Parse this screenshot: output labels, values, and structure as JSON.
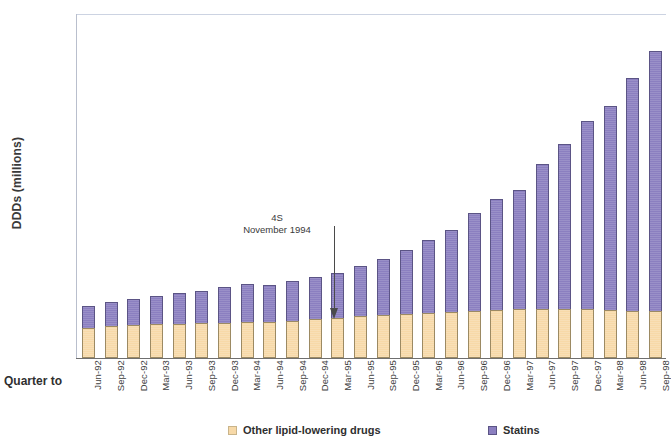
{
  "chart_data": {
    "type": "bar",
    "subtype": "stacked-bar",
    "title": "",
    "xlabel": "Quarter to",
    "ylabel": "DDDs (millions)",
    "ylim": [
      0,
      70
    ],
    "yticks": [
      0,
      10,
      20,
      30,
      40,
      50,
      60,
      70
    ],
    "grid": false,
    "legend_position": "bottom",
    "categories": [
      "Jun-92",
      "Sep-92",
      "Dec-92",
      "Mar-93",
      "Jun-93",
      "Sep-93",
      "Dec-93",
      "Mar-94",
      "Jun-94",
      "Sep-94",
      "Dec-94",
      "Mar-95",
      "Jun-95",
      "Sep-95",
      "Dec-95",
      "Mar-96",
      "Jun-96",
      "Sep-96",
      "Dec-96",
      "Mar-97",
      "Jun-97",
      "Sep-97",
      "Dec-97",
      "Mar-98",
      "Jun-98",
      "Sep-98"
    ],
    "series": [
      {
        "name": "Other lipid-lowering drugs",
        "color": "#f7d9a8",
        "values": [
          6.2,
          6.5,
          6.8,
          7.0,
          7.0,
          7.1,
          7.2,
          7.3,
          7.4,
          7.6,
          8.0,
          8.2,
          8.5,
          8.7,
          8.9,
          9.1,
          9.4,
          9.6,
          9.8,
          9.9,
          10.0,
          10.0,
          9.9,
          9.8,
          9.6,
          9.5
        ]
      },
      {
        "name": "Statins",
        "color": "#8b7fc0",
        "values": [
          4.3,
          5.0,
          5.2,
          5.6,
          6.3,
          6.6,
          7.2,
          7.7,
          7.4,
          8.1,
          8.5,
          9.1,
          10.3,
          11.5,
          13.1,
          15.0,
          16.7,
          20.0,
          22.6,
          24.2,
          29.4,
          33.6,
          38.4,
          41.4,
          47.4,
          53.0
        ]
      }
    ],
    "totals": [
      10.5,
      11.5,
      12.0,
      12.6,
      13.3,
      13.7,
      14.4,
      15.0,
      14.8,
      15.7,
      16.5,
      17.3,
      18.8,
      20.2,
      22.0,
      24.1,
      26.1,
      29.6,
      32.4,
      34.1,
      39.4,
      43.6,
      48.3,
      51.2,
      57.0,
      62.5
    ],
    "annotations": [
      {
        "id": "four-s-trial",
        "line1": "4S",
        "line2": "November 1994",
        "points_to_category": "Sep-94",
        "arrow": "down"
      }
    ]
  },
  "axes": {
    "y_title": "DDDs (millions)",
    "x_caption": "Quarter to",
    "y_tick_labels": [
      "0",
      "10",
      "20",
      "30",
      "40",
      "50",
      "60",
      "70"
    ]
  },
  "legend": {
    "items": [
      {
        "label": "Other lipid-lowering drugs",
        "color": "#f7d9a8"
      },
      {
        "label": "Statins",
        "color": "#8b7fc0"
      }
    ]
  },
  "colors": {
    "statins": "#8b7fc0",
    "other_lipid_lowering": "#f7d9a8",
    "axis": "#6f6f6f",
    "text": "#2b2b2b"
  }
}
